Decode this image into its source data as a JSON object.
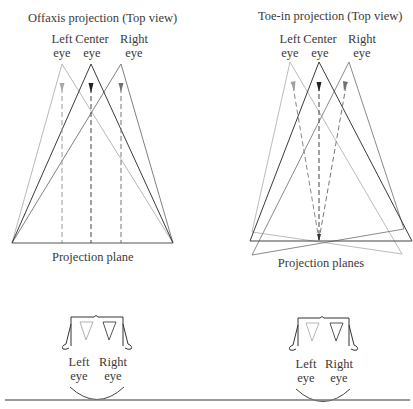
{
  "offaxis": {
    "title": "Offaxis projection (Top view)",
    "eye_labels": {
      "left": [
        "Left",
        "eye"
      ],
      "center": [
        "Center",
        "eye"
      ],
      "right": [
        "Right",
        "eye"
      ]
    },
    "plane_label": "Projection plane",
    "head": {
      "left": [
        "Left",
        "eye"
      ],
      "right": [
        "Right",
        "eye"
      ]
    }
  },
  "toein": {
    "title": "Toe-in projection (Top view)",
    "eye_labels": {
      "left": [
        "Left",
        "eye"
      ],
      "center": [
        "Center",
        "eye"
      ],
      "right": [
        "Right",
        "eye"
      ]
    },
    "plane_label": "Projection planes",
    "head": {
      "left": [
        "Left",
        "eye"
      ],
      "right": [
        "Right",
        "eye"
      ]
    }
  },
  "colors": {
    "left_eye": "#b5b5b5",
    "center_eye": "#333333",
    "right_eye": "#7a7a7a"
  }
}
